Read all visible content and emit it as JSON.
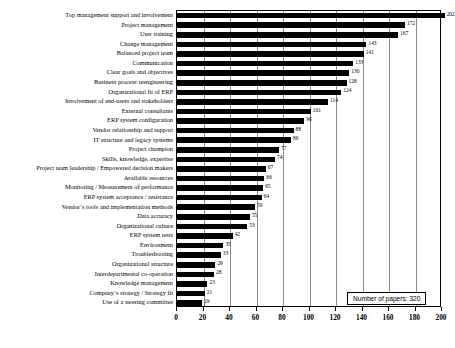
{
  "chart_data": {
    "type": "bar",
    "orientation": "horizontal",
    "title": "",
    "xlabel": "",
    "ylabel": "",
    "xlim": [
      0,
      200
    ],
    "grid": true,
    "xticks": [
      0,
      20,
      40,
      60,
      80,
      100,
      120,
      140,
      160,
      180,
      200
    ],
    "categories": [
      "Top management support and involvement",
      "Project management",
      "User training",
      "Change management",
      "Balanced project team",
      "Communication",
      "Clear goals and objectives",
      "Business process reengineering",
      "Organizational fit of ERP",
      "Involvement of end-users and stakeholders",
      "External consultants",
      "ERP system configuration",
      "Vendor relationship and support",
      "IT structure and legacy systems",
      "Project champion",
      "Skills, knowledge, expertise",
      "Project team leadership / Empowered decision makers",
      "Available resources",
      "Monitoring / Measurement of performance",
      "ERP system acceptance / resistance",
      "Vendor´s tools and implementation methods",
      "Data accuracy",
      "Organizational culture",
      "ERP system tests",
      "Environment",
      "Troubleshooting",
      "Organizational structure",
      "Interdepartmental co-operation",
      "Knowledge management",
      "Company´s strategy / Strategy fit",
      "Use of a steering committee"
    ],
    "values": [
      202,
      172,
      167,
      143,
      141,
      133,
      130,
      128,
      124,
      114,
      101,
      96,
      88,
      86,
      77,
      74,
      67,
      66,
      65,
      64,
      59,
      55,
      53,
      42,
      35,
      33,
      29,
      28,
      23,
      21,
      19
    ],
    "bar_color": "#000000",
    "legend_position": "bottom-right"
  },
  "legend": {
    "text": "Number of papers: 320"
  }
}
